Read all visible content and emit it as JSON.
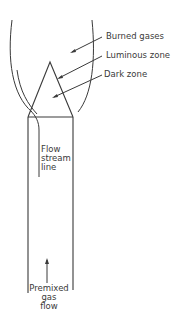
{
  "diagram": {
    "line_color": "#3a3a3a",
    "labels": {
      "burned_gases": "Burned gases",
      "luminous_zone": "Luminous zone",
      "dark_zone": "Dark zone",
      "flow_stream_line": [
        "Flow",
        "stream",
        "line"
      ],
      "premixed_gas_flow": [
        "Premixed",
        "gas",
        "flow"
      ]
    }
  }
}
